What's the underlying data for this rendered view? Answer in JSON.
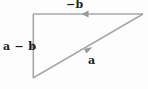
{
  "diagram": {
    "background_color": "#fdfdfd",
    "line_color": "#a8a8a8",
    "label_color": "#1c1c1c",
    "labels": {
      "top": "−b",
      "left": "a − b",
      "diagonal": "a"
    },
    "vectors": [
      {
        "name": "top-edge",
        "label": "−b",
        "from": [
          143,
          14
        ],
        "to": [
          33,
          14
        ],
        "direction": "left",
        "arrow_at": [
          85,
          14
        ]
      },
      {
        "name": "left-edge",
        "label": "a − b",
        "from": [
          33,
          78
        ],
        "to": [
          33,
          14
        ],
        "direction": "up",
        "arrow_at": [
          33,
          46
        ]
      },
      {
        "name": "diagonal-edge",
        "label": "a",
        "from": [
          33,
          78
        ],
        "to": [
          143,
          14
        ],
        "direction": "up-right",
        "arrow_at": [
          88,
          50
        ]
      }
    ],
    "vertices": {
      "top_left": [
        33,
        14
      ],
      "top_right": [
        143,
        14
      ],
      "bottom_left": [
        33,
        78
      ]
    }
  }
}
